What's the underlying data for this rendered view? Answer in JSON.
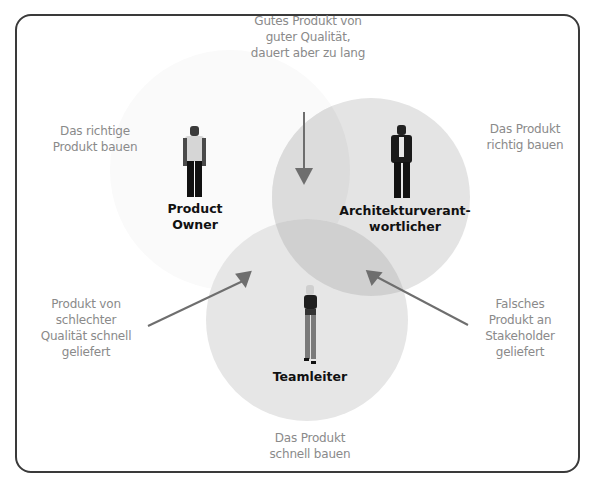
{
  "diagram": {
    "type": "venn",
    "colors": {
      "circle_fill": "#dcdcdc",
      "overlap_fill": "#c8c8c8",
      "arrow": "#6e6e6e",
      "label_gray": "#8a8a8a",
      "role_text": "#111111",
      "frame": "#3a3a3a"
    },
    "regions": {
      "product_owner": {
        "role": "Product\nOwner",
        "goal": "Das richtige\nProdukt bauen"
      },
      "architect": {
        "role": "Architekturverant-\nwortlicher",
        "goal": "Das Produkt\nrichtig bauen"
      },
      "team_lead": {
        "role": "Teamleiter",
        "goal": "Das Produkt\nschnell bauen"
      }
    },
    "annotations": {
      "top": "Gutes Produkt von\nguter Qualität,\ndauert aber zu lang",
      "left": "Produkt von\nschlechter\nQualität schnell\ngeliefert",
      "right": "Falsches\nProdukt an\nStakeholder\ngeliefert"
    }
  }
}
